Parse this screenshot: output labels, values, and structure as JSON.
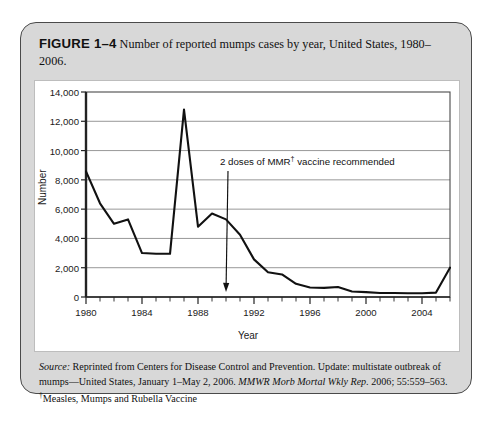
{
  "figure": {
    "label": "FIGURE 1–4",
    "caption": "Number of reported mumps cases by year, United States, 1980–2006.",
    "source_prefix": "Source:",
    "source_text": " Reprinted from Centers for Disease Control and Prevention. Update: multistate outbreak of mumps—United States, January 1–May 2, 2006. ",
    "source_italic": "MMWR Morb Mortal Wkly Rep.",
    "source_tail": " 2006; 55:559–563.",
    "footnote_marker": "†",
    "footnote_text": "Measles, Mumps and Rubella Vaccine"
  },
  "chart_data": {
    "type": "line",
    "title": "",
    "xlabel": "Year",
    "ylabel": "Number",
    "xlim": [
      1980,
      2006
    ],
    "ylim": [
      0,
      14000
    ],
    "ytick_step": 2000,
    "xtick_step": 4,
    "xtick_minor_step": 1,
    "grid": true,
    "legend": "none",
    "line_color": "#111111",
    "ytick_labels": [
      "14,000",
      "12,000",
      "10,000",
      "8,000",
      "6,000",
      "4,000",
      "2,000",
      "0"
    ],
    "ytick_values": [
      14000,
      12000,
      10000,
      8000,
      6000,
      4000,
      2000,
      0
    ],
    "xtick_labels": [
      "1980",
      "1984",
      "1988",
      "1992",
      "1996",
      "2000",
      "2004"
    ],
    "xtick_values": [
      1980,
      1984,
      1988,
      1992,
      1996,
      2000,
      2004
    ],
    "x": [
      1980,
      1981,
      1982,
      1983,
      1984,
      1985,
      1986,
      1987,
      1988,
      1989,
      1990,
      1991,
      1992,
      1993,
      1994,
      1995,
      1996,
      1997,
      1998,
      1999,
      2000,
      2001,
      2002,
      2003,
      2004,
      2005,
      2006
    ],
    "values": [
      8576,
      6400,
      5000,
      5300,
      3000,
      2950,
      2950,
      12800,
      4800,
      5700,
      5300,
      4250,
      2570,
      1690,
      1540,
      900,
      650,
      620,
      680,
      380,
      330,
      270,
      270,
      260,
      260,
      300,
      2000
    ],
    "annotations": [
      {
        "text": "2 doses of MMR† vaccine recommended",
        "marker": "†",
        "points_to_year": 1990,
        "points_to_value": 350
      }
    ]
  }
}
